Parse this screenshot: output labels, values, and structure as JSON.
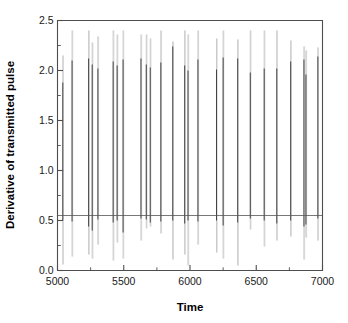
{
  "chart_data": {
    "type": "line",
    "title": "",
    "xlabel": "Time",
    "ylabel": "Derivative of transmitted pulse",
    "xlim": [
      5000,
      7000
    ],
    "ylim": [
      0.0,
      2.5
    ],
    "xticks": [
      5000,
      5500,
      6000,
      6500,
      7000
    ],
    "xtick_labels": [
      "5000",
      "5500",
      "6000",
      "6500",
      "7000"
    ],
    "yticks": [
      0.0,
      0.5,
      1.0,
      1.5,
      2.0,
      2.5
    ],
    "ytick_labels": [
      "0.0",
      "0.5",
      "1.0",
      "1.5",
      "2.0",
      "2.5"
    ],
    "x_minor_interval": 250,
    "y_minor_interval": 0.25,
    "grid": false,
    "legend": null,
    "baseline_value": 0.55,
    "series": [
      {
        "name": "Derivative of transmitted pulse",
        "description": "Periodic impulse train: quiet baseline near 0.55 interrupted by narrow bipolar spikes",
        "spikes": [
          {
            "x": 5040,
            "top": 2.15,
            "bottom": 0.06,
            "core_top": 1.88,
            "core_bottom": 0.5
          },
          {
            "x": 5110,
            "top": 2.4,
            "bottom": 0.14,
            "core_top": 2.1,
            "core_bottom": 0.49
          },
          {
            "x": 5235,
            "top": 2.4,
            "bottom": 0.16,
            "core_top": 2.12,
            "core_bottom": 0.44
          },
          {
            "x": 5262,
            "top": 2.28,
            "bottom": 0.12,
            "core_top": 2.06,
            "core_bottom": 0.4
          },
          {
            "x": 5305,
            "top": 2.34,
            "bottom": 0.26,
            "core_top": 2.02,
            "core_bottom": 0.51
          },
          {
            "x": 5420,
            "top": 2.4,
            "bottom": 0.1,
            "core_top": 2.09,
            "core_bottom": 0.48
          },
          {
            "x": 5450,
            "top": 2.36,
            "bottom": 0.28,
            "core_top": 2.05,
            "core_bottom": 0.5
          },
          {
            "x": 5495,
            "top": 2.4,
            "bottom": 0.12,
            "core_top": 2.11,
            "core_bottom": 0.38
          },
          {
            "x": 5630,
            "top": 2.36,
            "bottom": 0.3,
            "core_top": 2.12,
            "core_bottom": 0.52
          },
          {
            "x": 5670,
            "top": 2.36,
            "bottom": 0.42,
            "core_top": 2.06,
            "core_bottom": 0.51
          },
          {
            "x": 5700,
            "top": 2.32,
            "bottom": 0.44,
            "core_top": 2.03,
            "core_bottom": 0.48
          },
          {
            "x": 5780,
            "top": 2.4,
            "bottom": 0.37,
            "core_top": 2.08,
            "core_bottom": 0.49
          },
          {
            "x": 5870,
            "top": 2.29,
            "bottom": 0.11,
            "core_top": 2.24,
            "core_bottom": 0.5
          },
          {
            "x": 5960,
            "top": 2.4,
            "bottom": 0.16,
            "core_top": 2.05,
            "core_bottom": 0.47
          },
          {
            "x": 5985,
            "top": 2.36,
            "bottom": 0.05,
            "core_top": 2.0,
            "core_bottom": 0.5
          },
          {
            "x": 6060,
            "top": 2.4,
            "bottom": 0.26,
            "core_top": 2.11,
            "core_bottom": 0.49
          },
          {
            "x": 6200,
            "top": 2.32,
            "bottom": 0.18,
            "core_top": 2.01,
            "core_bottom": 0.5
          },
          {
            "x": 6250,
            "top": 2.4,
            "bottom": 0.12,
            "core_top": 2.13,
            "core_bottom": 0.45
          },
          {
            "x": 6360,
            "top": 2.31,
            "bottom": 0.05,
            "core_top": 2.12,
            "core_bottom": 0.48
          },
          {
            "x": 6455,
            "top": 2.4,
            "bottom": 0.41,
            "core_top": 1.98,
            "core_bottom": 0.52
          },
          {
            "x": 6560,
            "top": 2.4,
            "bottom": 0.24,
            "core_top": 2.02,
            "core_bottom": 0.5
          },
          {
            "x": 6655,
            "top": 2.4,
            "bottom": 0.3,
            "core_top": 2.02,
            "core_bottom": 0.47
          },
          {
            "x": 6760,
            "top": 2.3,
            "bottom": 0.34,
            "core_top": 2.09,
            "core_bottom": 0.5
          },
          {
            "x": 6860,
            "top": 2.24,
            "bottom": 0.11,
            "core_top": 2.11,
            "core_bottom": 0.44
          },
          {
            "x": 6875,
            "top": 2.2,
            "bottom": 0.33,
            "core_top": 1.96,
            "core_bottom": 0.46
          },
          {
            "x": 6965,
            "top": 2.23,
            "bottom": 0.3,
            "core_top": 2.14,
            "core_bottom": 0.52
          }
        ]
      }
    ]
  },
  "axis": {
    "y_title": "Derivative of transmitted pulse",
    "x_title": "Time"
  }
}
